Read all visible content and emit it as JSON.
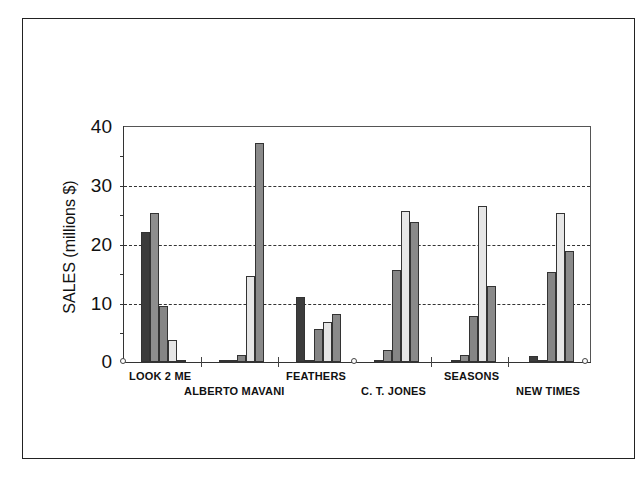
{
  "chart_data": {
    "type": "bar",
    "title": "",
    "xlabel": "",
    "ylabel": "SALES (millions $)",
    "ylim": [
      0,
      40
    ],
    "yticks": [
      0,
      10,
      20,
      30,
      40
    ],
    "grid": "horizontal dashed at 10, 20, 30",
    "legend": "none",
    "categories": [
      "LOOK 2 ME",
      "ALBERTO MAVANI",
      "FEATHERS",
      "C. T. JONES",
      "SEASONS",
      "NEW TIMES"
    ],
    "series": [
      {
        "name": "Series 1",
        "color": "#3c3c3c",
        "values": [
          22.1,
          0.1,
          11.1,
          0.2,
          0.1,
          1.1
        ]
      },
      {
        "name": "Series 2",
        "color": "#8e8e8e",
        "values": [
          25.3,
          0.3,
          0.1,
          2.0,
          1.2,
          0.4
        ]
      },
      {
        "name": "Series 3",
        "color": "#858585",
        "values": [
          9.5,
          1.2,
          5.6,
          15.6,
          7.8,
          15.3
        ]
      },
      {
        "name": "Series 4",
        "color": "#e6e6e6",
        "values": [
          3.7,
          14.6,
          6.7,
          25.6,
          26.5,
          25.2
        ]
      },
      {
        "name": "Series 5",
        "color": "#8a8a8a",
        "values": [
          0.1,
          37.2,
          8.1,
          23.7,
          12.8,
          18.9
        ]
      }
    ]
  },
  "axis": {
    "ylabel": "SALES (millions $)",
    "ticks": [
      "40",
      "30",
      "20",
      "10",
      "0"
    ]
  },
  "labels": {
    "c0": "LOOK 2 ME",
    "c1": "ALBERTO MAVANI",
    "c2": "FEATHERS",
    "c3": "C. T. JONES",
    "c4": "SEASONS",
    "c5": "NEW TIMES"
  }
}
